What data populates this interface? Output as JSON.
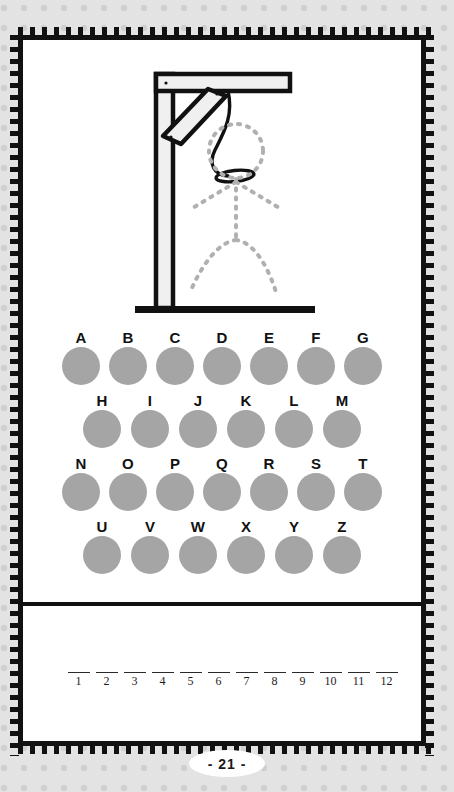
{
  "page": {
    "number_label": "- 21 -",
    "background_color": "#e3e3e3",
    "card_color": "#ffffff",
    "border_color": "#111111"
  },
  "puzzle": {
    "type": "hangman",
    "illustration": {
      "name": "gallows-with-dotted-stick-figure",
      "parts": [
        "vertical-post",
        "horizontal-beam",
        "diagonal-brace",
        "base-bar",
        "rope",
        "noose-loop"
      ],
      "figure_state": "dotted-outline",
      "beam_fill": "#f0f0f0",
      "beam_stroke": "#111111",
      "rope_color": "#111111",
      "figure_dot_color": "#b0b0b0"
    },
    "letters": {
      "circle_color": "#a5a5a5",
      "rows": [
        {
          "row_index": 0,
          "items": [
            "A",
            "B",
            "C",
            "D",
            "E",
            "F",
            "G"
          ]
        },
        {
          "row_index": 1,
          "items": [
            "H",
            "I",
            "J",
            "K",
            "L",
            "M"
          ]
        },
        {
          "row_index": 2,
          "items": [
            "N",
            "O",
            "P",
            "Q",
            "R",
            "S",
            "T"
          ]
        },
        {
          "row_index": 3,
          "items": [
            "U",
            "V",
            "W",
            "X",
            "Y",
            "Z"
          ]
        }
      ]
    }
  },
  "answer": {
    "blanks": [
      {
        "number": "1",
        "value": ""
      },
      {
        "number": "2",
        "value": ""
      },
      {
        "number": "3",
        "value": ""
      },
      {
        "number": "4",
        "value": ""
      },
      {
        "number": "5",
        "value": ""
      },
      {
        "number": "6",
        "value": ""
      },
      {
        "number": "7",
        "value": ""
      },
      {
        "number": "8",
        "value": ""
      },
      {
        "number": "9",
        "value": ""
      },
      {
        "number": "10",
        "value": ""
      },
      {
        "number": "11",
        "value": ""
      },
      {
        "number": "12",
        "value": ""
      }
    ]
  }
}
